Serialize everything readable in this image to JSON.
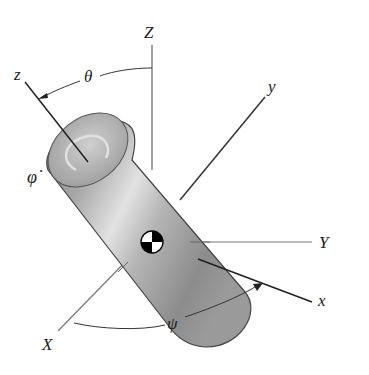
{
  "diagram": {
    "type": "rigid-body-rotation-euler-angles",
    "labels": {
      "Z_axis": "Z",
      "Y_axis": "Y",
      "X_axis": "X",
      "z_axis": "z",
      "y_axis": "y",
      "x_axis": "x",
      "theta": "θ",
      "psi": "ψ",
      "phi_dot": "φ̇"
    },
    "colors": {
      "background": "#ffffff",
      "axis_line": "#555555",
      "body_axis_line": "#222222",
      "cylinder_light": "#d8d8d8",
      "cylinder_dark": "#7a7a7a",
      "outline": "#444444"
    },
    "elements": [
      "fixed-frame-Z-axis",
      "fixed-frame-Y-axis",
      "fixed-frame-X-axis",
      "body-frame-z-axis",
      "body-frame-y-axis",
      "body-frame-x-axis",
      "cylinder",
      "center-of-mass-symbol",
      "theta-arc",
      "psi-arc",
      "phi-dot-spin-marker"
    ]
  }
}
